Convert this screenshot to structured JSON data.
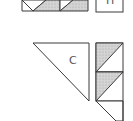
{
  "diagram": {
    "colors": {
      "outline": "#3a3a3a",
      "shaded": "#c8c8c8",
      "plain": "#ffffff"
    },
    "pieces": [
      {
        "id": "top-strip",
        "description": "shaded half-square triangles (cropped)"
      },
      {
        "id": "top-box",
        "label": "H",
        "description": "labeled square (cropped)"
      },
      {
        "id": "triangle-c",
        "label": "C",
        "description": "large right triangle"
      },
      {
        "id": "right-column",
        "description": "strip of half-square triangles"
      }
    ]
  }
}
